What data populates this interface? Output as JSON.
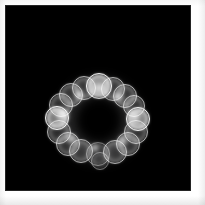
{
  "figure": {
    "width": 205,
    "height": 205,
    "page_background": "#ffffff",
    "plate_background": "#000000",
    "caption": ""
  },
  "plate": {
    "x": 5,
    "y": 5,
    "width": 186,
    "height": 186
  },
  "pattern": {
    "name": "bokeh-ring",
    "description": "Annular cluster of overlapping luminous circles with dark center",
    "center_x": 94,
    "center_y": 115,
    "ring_radius": 31,
    "outer_extent": 48,
    "core_radius": 22,
    "circle_count": 17,
    "glow_color": "#ffffff",
    "core_color": "#000000"
  },
  "circles": [
    {
      "cx": 94,
      "cy": 81,
      "r": 13,
      "level": "bright"
    },
    {
      "cx": 79,
      "cy": 83,
      "r": 12,
      "level": "normal"
    },
    {
      "cx": 108,
      "cy": 84,
      "r": 12,
      "level": "normal"
    },
    {
      "cx": 66,
      "cy": 90,
      "r": 12,
      "level": "normal"
    },
    {
      "cx": 120,
      "cy": 91,
      "r": 12,
      "level": "normal"
    },
    {
      "cx": 56,
      "cy": 100,
      "r": 12,
      "level": "normal"
    },
    {
      "cx": 129,
      "cy": 101,
      "r": 11,
      "level": "normal"
    },
    {
      "cx": 52,
      "cy": 113,
      "r": 12,
      "level": "bright"
    },
    {
      "cx": 133,
      "cy": 114,
      "r": 12,
      "level": "bright"
    },
    {
      "cx": 54,
      "cy": 127,
      "r": 12,
      "level": "normal"
    },
    {
      "cx": 131,
      "cy": 127,
      "r": 12,
      "level": "normal"
    },
    {
      "cx": 63,
      "cy": 139,
      "r": 12,
      "level": "normal"
    },
    {
      "cx": 123,
      "cy": 139,
      "r": 12,
      "level": "normal"
    },
    {
      "cx": 76,
      "cy": 146,
      "r": 12,
      "level": "normal"
    },
    {
      "cx": 110,
      "cy": 147,
      "r": 12,
      "level": "normal"
    },
    {
      "cx": 93,
      "cy": 149,
      "r": 12,
      "level": "dim"
    },
    {
      "cx": 95,
      "cy": 156,
      "r": 9,
      "level": "dim"
    }
  ],
  "hotspots": [
    {
      "cx": 94,
      "cy": 83,
      "r": 9
    },
    {
      "cx": 57,
      "cy": 110,
      "r": 9
    },
    {
      "cx": 130,
      "cy": 112,
      "r": 8
    },
    {
      "cx": 74,
      "cy": 90,
      "r": 6
    },
    {
      "cx": 114,
      "cy": 92,
      "r": 6
    },
    {
      "cx": 66,
      "cy": 134,
      "r": 6
    },
    {
      "cx": 118,
      "cy": 136,
      "r": 6
    },
    {
      "cx": 90,
      "cy": 143,
      "r": 5
    }
  ],
  "chart_data": {
    "type": "scatter",
    "title": "",
    "xlabel": "",
    "ylabel": "",
    "xlim": [
      0,
      186
    ],
    "ylim": [
      0,
      186
    ],
    "grid": false,
    "legend": null,
    "background": "#000000",
    "marker": "open circle with radial glow",
    "series": [
      {
        "name": "bokeh-ring",
        "x": [
          94,
          79,
          108,
          66,
          120,
          56,
          129,
          52,
          133,
          54,
          131,
          63,
          123,
          76,
          110,
          93,
          95
        ],
        "y": [
          81,
          83,
          84,
          90,
          91,
          100,
          101,
          113,
          114,
          127,
          127,
          139,
          139,
          146,
          147,
          149,
          156
        ],
        "r": [
          13,
          12,
          12,
          12,
          12,
          12,
          11,
          12,
          12,
          12,
          12,
          12,
          12,
          12,
          12,
          12,
          9
        ]
      }
    ]
  }
}
